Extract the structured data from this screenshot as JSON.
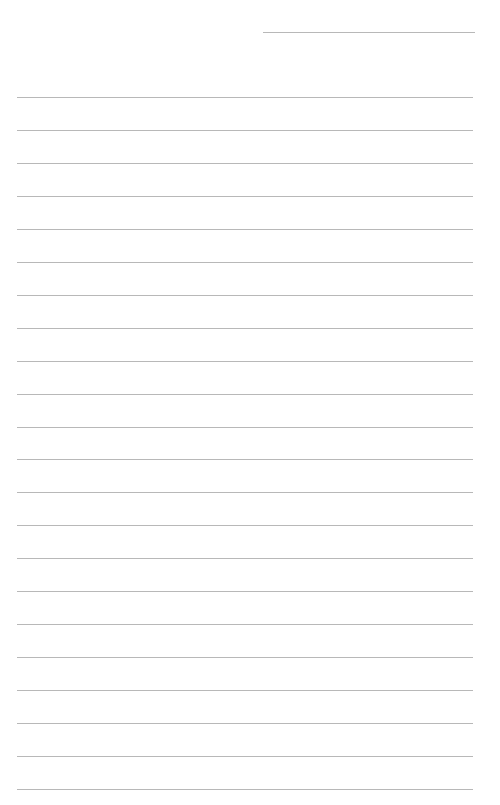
{
  "page": {
    "type": "lined-paper",
    "background": "#ffffff",
    "line_color": "#b8b8b8",
    "header_line": {
      "x": 263,
      "y": 32,
      "width": 212
    },
    "rules": {
      "count": 22,
      "first_y": 97,
      "spacing": 32.95,
      "x": 17,
      "width": 456
    }
  }
}
